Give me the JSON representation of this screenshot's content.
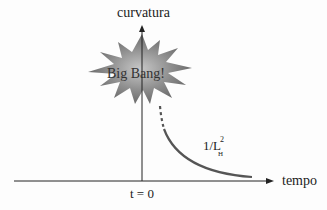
{
  "diagram": {
    "y_axis_label": "curvatura",
    "x_axis_label": "tempo",
    "origin_label": "t = 0",
    "burst_label": "Big Bang!",
    "curve_label": {
      "base": "1/L",
      "sup": "2",
      "sub": "H"
    },
    "colors": {
      "curve": "#555555",
      "axes": "#222222",
      "burst": "#8a8a8a"
    }
  }
}
